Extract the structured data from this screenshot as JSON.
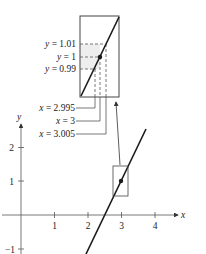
{
  "diagram": {
    "colors": {
      "ink": "#1a1a1a",
      "guide": "#555555",
      "shade": "#eeeeee"
    },
    "axes": {
      "x_label": "x",
      "y_label": "y",
      "x_ticks": [
        "1",
        "2",
        "3",
        "4"
      ],
      "y_ticks": [
        "2",
        "1",
        "−1"
      ],
      "x_range": [
        -0.5,
        4.7
      ],
      "y_range": [
        -1,
        2.6
      ]
    },
    "line": {
      "point": [
        3,
        1
      ],
      "slope": 3
    },
    "highlight_point": {
      "x": 3,
      "y": 1
    },
    "inset": {
      "y_labels": [
        "y = 1.01",
        "y = 1",
        "y = 0.99"
      ],
      "x_labels": [
        "x = 2.995",
        "x = 3",
        "x = 3.005"
      ],
      "y_values": [
        1.01,
        1,
        0.99
      ],
      "x_values": [
        2.995,
        3,
        3.005
      ]
    }
  }
}
